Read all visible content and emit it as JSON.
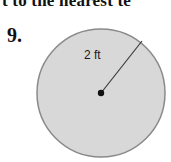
{
  "header": {
    "text": "t to the nearest te"
  },
  "problem": {
    "number": "9.",
    "figure": {
      "shape": "circle",
      "radius_label": "2 ft",
      "fill_color": "#d6d6d6",
      "stroke_color": "#808080"
    }
  }
}
